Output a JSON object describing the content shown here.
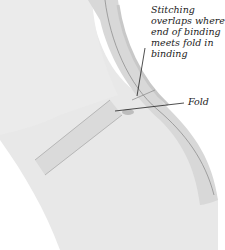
{
  "diagram": {
    "type": "sewing-illustration",
    "callouts": {
      "stitching": "Stitching overlaps where end of binding meets fold in binding",
      "fold": "Fold"
    },
    "colors": {
      "fabric": "#e9e9e9",
      "binding": "#dcdcdc",
      "stitch_line": "#7a7a7a",
      "leader_line": "#222222"
    }
  }
}
